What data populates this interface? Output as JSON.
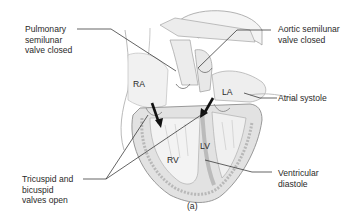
{
  "figure": {
    "caption": "(a)",
    "chambers": {
      "ra": "RA",
      "la": "LA",
      "rv": "RV",
      "lv": "LV"
    },
    "labels": {
      "pulmonary": "Pulmonary\nsemilunar\nvalve closed",
      "aortic": "Aortic semilunar\nvalve closed",
      "atrial": "Atrial systole",
      "av_valves": "Tricuspid and\nbicuspid\nvalves open",
      "ventricular": "Ventricular\ndiastole"
    },
    "colors": {
      "outline": "#8a8a8a",
      "fill_light": "#efefef",
      "fill_mid": "#d6d6d6",
      "arrow": "#111111",
      "leader": "#222222"
    }
  }
}
